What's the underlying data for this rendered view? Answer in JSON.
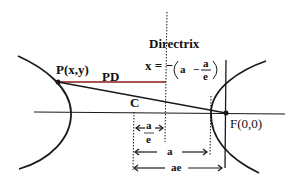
{
  "diagram": {
    "labels": {
      "point_p": "P(x,y)",
      "pd": "PD",
      "directrix": "Directrix",
      "directrix_eq_lhs": "x = −",
      "directrix_eq_a": "a",
      "directrix_eq_minus": "−",
      "directrix_eq_frac_num": "a",
      "directrix_eq_frac_den": "e",
      "center": "C",
      "focus": "F(0,0)",
      "dim_a_over_e_num": "a",
      "dim_a_over_e_den": "e",
      "dim_a": "a",
      "dim_ae": "ae"
    },
    "colors": {
      "stroke": "#1a1a1a",
      "pd_line": "#8b1a1a",
      "background": "#ffffff"
    }
  }
}
